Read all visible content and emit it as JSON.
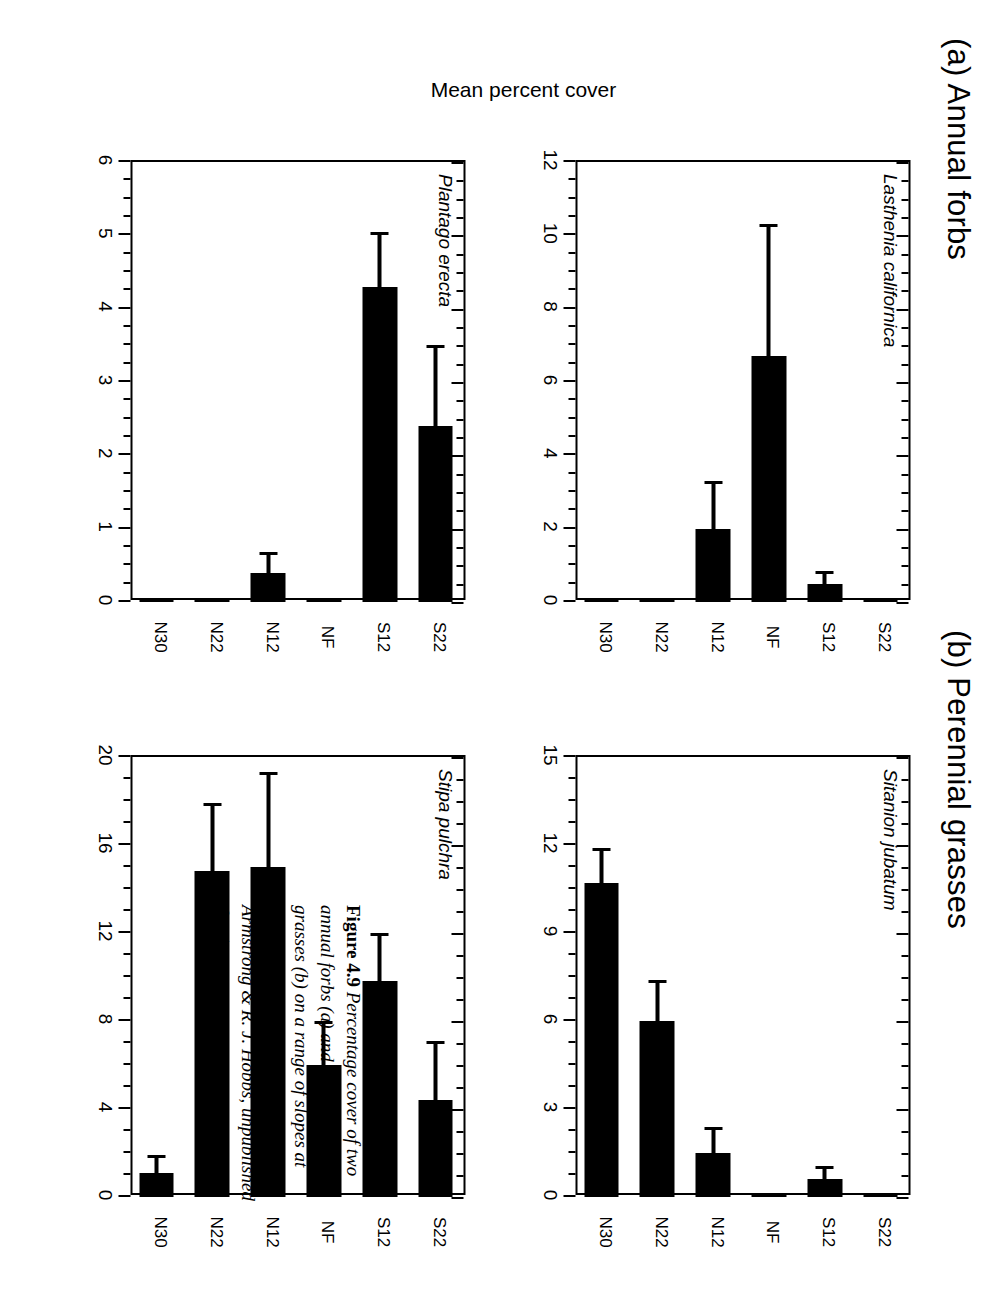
{
  "figure": {
    "caption_label": "Figure 4.9",
    "caption_text": "Percentage cover of two annual forbs (a) and two perennial grasses (b) on a range of slopes at Morgan Hill, California (J. K. Armstrong & R. J. Hobbs, unpublished data).",
    "y_axis_label": "Mean percent cover",
    "section_a_title": "(a) Annual forbs",
    "section_b_title": "(b) Perennial grasses"
  },
  "chart_data": [
    {
      "type": "bar",
      "panel": "a-left",
      "title": "Lasthenia californica",
      "categories": [
        "S22",
        "S12",
        "NF",
        "N12",
        "N22",
        "N30"
      ],
      "values": [
        0,
        0.5,
        6.7,
        2.0,
        0,
        0
      ],
      "errors": [
        0,
        0.35,
        3.6,
        1.3,
        0,
        0
      ],
      "xlabel": "",
      "ylabel": "Mean percent cover",
      "ylim": [
        0,
        12
      ],
      "yticks": [
        0,
        2,
        4,
        6,
        8,
        10,
        12
      ],
      "ytick_labels": [
        "0",
        "2",
        "4",
        "6",
        "8",
        "10",
        "12"
      ],
      "grid": false,
      "legend": "none",
      "orientation": "vertical"
    },
    {
      "type": "bar",
      "panel": "a-right",
      "title": "Plantago erecta",
      "categories": [
        "S22",
        "S12",
        "NF",
        "N12",
        "N22",
        "N30"
      ],
      "values": [
        2.4,
        4.3,
        0,
        0.4,
        0,
        0
      ],
      "errors": [
        1.1,
        0.75,
        0,
        0.28,
        0,
        0
      ],
      "xlabel": "",
      "ylabel": "Mean percent cover",
      "ylim": [
        0,
        6
      ],
      "yticks": [
        0,
        1,
        2,
        3,
        4,
        5,
        6
      ],
      "ytick_labels": [
        "0",
        "1",
        "2",
        "3",
        "4",
        "5",
        "6"
      ],
      "grid": false,
      "legend": "none",
      "orientation": "vertical"
    },
    {
      "type": "bar",
      "panel": "b-left",
      "title": "Sitanion jubatum",
      "categories": [
        "S22",
        "S12",
        "NF",
        "N12",
        "N22",
        "N30"
      ],
      "values": [
        0,
        0.6,
        0,
        1.5,
        6.0,
        10.7
      ],
      "errors": [
        0,
        0.45,
        0,
        0.9,
        1.4,
        1.2
      ],
      "xlabel": "",
      "ylabel": "Mean percent cover",
      "ylim": [
        0,
        15
      ],
      "yticks": [
        0,
        3,
        6,
        9,
        12,
        15
      ],
      "ytick_labels": [
        "0",
        "3",
        "6",
        "9",
        "12",
        "15"
      ],
      "grid": false,
      "legend": "none",
      "orientation": "vertical"
    },
    {
      "type": "bar",
      "panel": "b-right",
      "title": "Stipa pulchra",
      "categories": [
        "S22",
        "S12",
        "NF",
        "N12",
        "N22",
        "N30"
      ],
      "values": [
        4.4,
        9.8,
        6.0,
        15.0,
        14.8,
        1.1
      ],
      "errors": [
        2.7,
        2.2,
        2.0,
        4.3,
        3.1,
        0.8
      ],
      "xlabel": "",
      "ylabel": "Mean percent cover",
      "ylim": [
        0,
        20
      ],
      "yticks": [
        0,
        4,
        8,
        12,
        16,
        20
      ],
      "ytick_labels": [
        "0",
        "4",
        "8",
        "12",
        "16",
        "20"
      ],
      "grid": false,
      "legend": "none",
      "orientation": "vertical"
    }
  ]
}
